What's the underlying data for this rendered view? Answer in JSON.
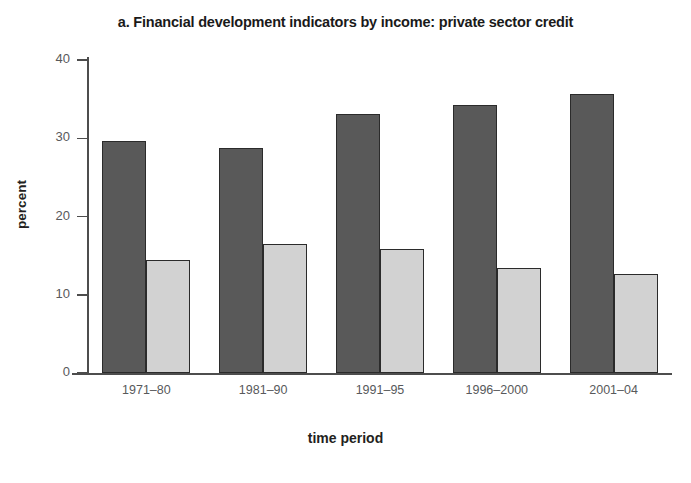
{
  "chart_data": {
    "type": "bar",
    "title": "a. Financial development indicators by income: private sector credit",
    "xlabel": "time period",
    "ylabel": "percent",
    "categories": [
      "1971–80",
      "1981–90",
      "1991–95",
      "1996–2000",
      "2001–04"
    ],
    "series": [
      {
        "name": "series-1",
        "color": "#595959",
        "values": [
          29.6,
          28.8,
          33.1,
          34.2,
          35.7
        ]
      },
      {
        "name": "series-2",
        "color": "#d2d2d2",
        "values": [
          14.4,
          16.5,
          15.9,
          13.4,
          12.7
        ]
      }
    ],
    "ylim": [
      0,
      40
    ],
    "yticks": [
      0,
      10,
      20,
      30,
      40
    ],
    "ytick_labels": [
      "0",
      "10",
      "20",
      "30",
      "40"
    ],
    "grid": false,
    "legend": "none"
  },
  "axis": {
    "y_tick_0": "0",
    "y_tick_1": "10",
    "y_tick_2": "20",
    "y_tick_3": "30",
    "y_tick_4": "40"
  },
  "colors": {
    "series_dark": "#595959",
    "series_light": "#d2d2d2",
    "axis": "#4d4d4d",
    "text": "#231f20",
    "tick_text": "#58595b",
    "background": "#ffffff"
  }
}
